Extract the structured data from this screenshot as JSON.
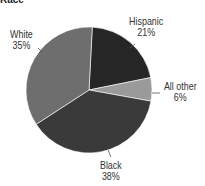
{
  "chart_data": {
    "type": "pie",
    "title": "Race",
    "categories": [
      "Hispanic",
      "All other",
      "Black",
      "White"
    ],
    "values": [
      21,
      6,
      38,
      35
    ],
    "labels": [
      "Hispanic 21%",
      "All other 6%",
      "Black 38%",
      "White 35%"
    ],
    "colors": [
      "#262626",
      "#9a9a9a",
      "#3a3a3a",
      "#6e6e6e"
    ]
  },
  "labels": {
    "hispanic": {
      "name": "Hispanic",
      "pct": "21%"
    },
    "other": {
      "name": "All other",
      "pct": "6%"
    },
    "black": {
      "name": "Black",
      "pct": "38%"
    },
    "white": {
      "name": "White",
      "pct": "35%"
    }
  }
}
